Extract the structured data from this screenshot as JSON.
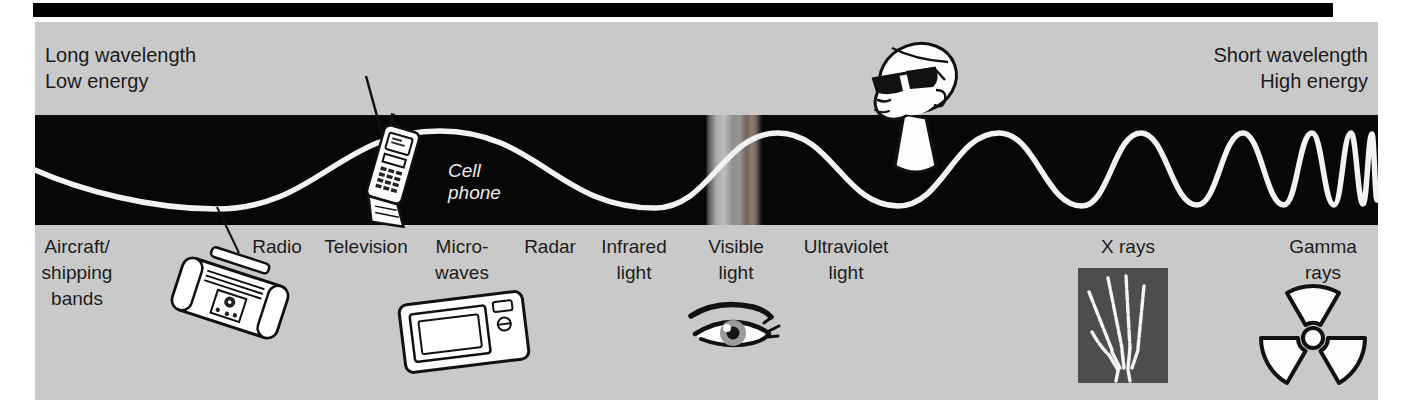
{
  "header": {
    "left": [
      "Long wavelength",
      "Low energy"
    ],
    "right": [
      "Short wavelength",
      "High energy"
    ]
  },
  "cell_phone_label": [
    "Cell",
    "phone"
  ],
  "spectrum": {
    "labels": [
      {
        "lines": [
          "Aircraft/",
          "shipping",
          "bands"
        ],
        "x": 77
      },
      {
        "lines": [
          "Radio"
        ],
        "x": 277
      },
      {
        "lines": [
          "Television"
        ],
        "x": 366
      },
      {
        "lines": [
          "Micro-",
          "waves"
        ],
        "x": 462
      },
      {
        "lines": [
          "Radar"
        ],
        "x": 550
      },
      {
        "lines": [
          "Infrared",
          "light"
        ],
        "x": 634
      },
      {
        "lines": [
          "Visible",
          "light"
        ],
        "x": 736
      },
      {
        "lines": [
          "Ultraviolet",
          "light"
        ],
        "x": 846
      },
      {
        "lines": [
          "X rays"
        ],
        "x": 1128
      },
      {
        "lines": [
          "Gamma",
          "rays"
        ],
        "x": 1323
      }
    ]
  },
  "colors": {
    "panel_gray": "#c9c9c9",
    "band_black": "#070707",
    "wave_white": "#f2f2f2",
    "text_dark": "#1c1c1c",
    "xray_background": "#4d4d4d",
    "top_bar": "#000000"
  }
}
